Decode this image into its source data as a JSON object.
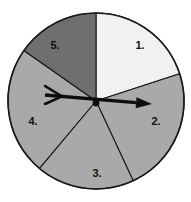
{
  "figure": {
    "name": "spinner-wheel",
    "background_color": "#ffffff",
    "outline_color": "#1a1a1a",
    "center": {
      "x": 96,
      "y": 101
    },
    "radius": 88
  },
  "chart_data": {
    "type": "pie",
    "title": "",
    "xlabel": "",
    "ylabel": "",
    "legend": "none",
    "grid": false,
    "categories": [
      "1.",
      "2.",
      "3.",
      "4.",
      "5."
    ],
    "values": [
      72,
      83,
      65,
      85,
      55
    ],
    "units": "degrees",
    "slices": [
      {
        "label": "1.",
        "start_angle": 90,
        "end_angle": 18,
        "sweep": 72,
        "color": "#f1f1ef",
        "label_x": 140,
        "label_y": 46
      },
      {
        "label": "2.",
        "start_angle": 18,
        "end_angle": -65,
        "sweep": 83,
        "color": "#a9a9a9",
        "label_x": 156,
        "label_y": 122
      },
      {
        "label": "3.",
        "start_angle": -65,
        "end_angle": -130,
        "sweep": 65,
        "color": "#a9a9a9",
        "label_x": 97,
        "label_y": 174
      },
      {
        "label": "4.",
        "start_angle": -130,
        "end_angle": 145,
        "sweep": 85,
        "color": "#a9a9a9",
        "label_x": 33,
        "label_y": 122
      },
      {
        "label": "5.",
        "start_angle": 145,
        "end_angle": 90,
        "sweep": 55,
        "color": "#6f6f6f",
        "label_x": 55,
        "label_y": 46
      }
    ],
    "pointer": {
      "name": "spinner-arrow",
      "color": "#0d0d0d",
      "tip": {
        "x": 152,
        "y": 104
      },
      "tail": {
        "x": 45,
        "y": 95
      },
      "pivot": {
        "x": 96,
        "y": 103
      },
      "direction_degrees": -3,
      "points_to_slice": "2."
    }
  }
}
